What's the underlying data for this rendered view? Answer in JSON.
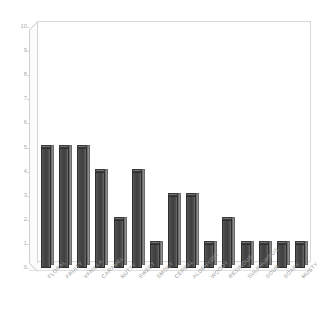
{
  "chart_data": {
    "type": "bar",
    "title": "",
    "subtitle": "",
    "xlabel": "",
    "ylabel": "",
    "ylim": [
      0,
      10
    ],
    "ytick_labels": [
      "10",
      "9",
      "8",
      "7",
      "6",
      "5",
      "4",
      "3",
      "2",
      "1",
      "0"
    ],
    "ytick_values": [
      10,
      9,
      8,
      7,
      6,
      5,
      4,
      3,
      2,
      1,
      0
    ],
    "grid": false,
    "legend": false,
    "legend_position": "none",
    "style": "3d-bar",
    "bar_color": "#454545",
    "bar_side_color": "#8d8d8d",
    "bar_top_color": "#6f6f6f",
    "axis_text_color": "#a0a0a0",
    "frame_color": "#d8d8d8",
    "background_color": "#ffffff",
    "categories": [
      "FLORAL",
      "FRUITY",
      "VANILLA",
      "CARAMEL",
      "NUTTY",
      "SWEET",
      "SMOKY",
      "CEREAL",
      "ALDEHYDIC",
      "WOODY",
      "RESINOUS",
      "SULPHUROUS",
      "SOUR",
      "SOAPY",
      "MUSTY"
    ],
    "values": [
      5,
      5,
      5,
      4,
      2,
      4,
      1,
      3,
      3,
      1,
      2,
      1,
      1,
      1,
      1
    ]
  }
}
